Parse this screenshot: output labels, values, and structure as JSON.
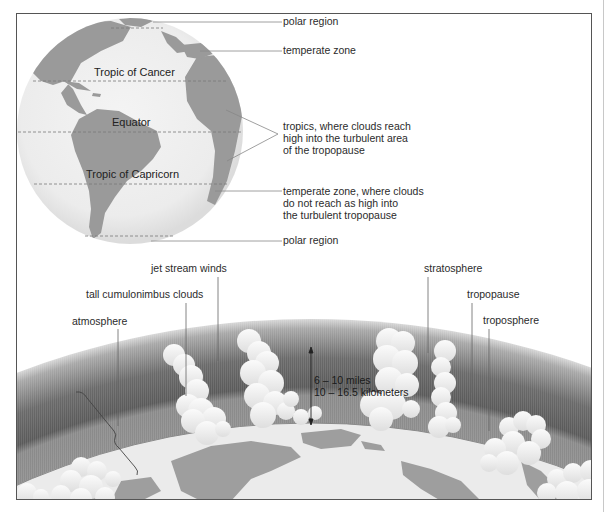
{
  "figure": {
    "globe": {
      "latitude_labels": {
        "tropic_of_cancer": "Tropic of Cancer",
        "equator": "Equator",
        "tropic_of_capricorn": "Tropic of Capricorn"
      },
      "callouts": {
        "polar_top": "polar region",
        "temperate_top": "temperate zone",
        "tropics_line1": "tropics, where clouds reach",
        "tropics_line2": "high into the turbulent area",
        "tropics_line3": "of the tropopause",
        "temperate_bottom_line1": "temperate zone, where clouds",
        "temperate_bottom_line2": "do not reach as high into",
        "temperate_bottom_line3": "the turbulent tropopause",
        "polar_bottom": "polar region"
      }
    },
    "atmosphere_section": {
      "labels": {
        "jet_stream": "jet stream winds",
        "cumulonimbus": "tall cumulonimbus clouds",
        "atmosphere": "atmosphere",
        "stratosphere": "stratosphere",
        "tropopause": "tropopause",
        "troposphere": "troposphere"
      },
      "dimension": {
        "miles": "6 – 10 miles",
        "kilometers": "10 – 16.5 kilometers"
      }
    },
    "colors": {
      "ocean": "#ececec",
      "land": "#9a9a9a",
      "stratosphere": "#7d7d7d",
      "tropopause_dark": "#555555",
      "troposphere": "#8f8f8f",
      "cloud": "#f4f4f4",
      "leader_line": "#888888"
    }
  }
}
